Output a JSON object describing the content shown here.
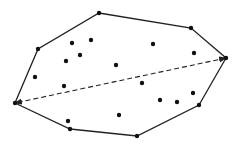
{
  "diagram": {
    "type": "convex-hull-diameter",
    "colors": {
      "line": "#222222",
      "point": "#111111",
      "background": "#ffffff"
    },
    "hull_vertices": [
      [
        99,
        13
      ],
      [
        191,
        28
      ],
      [
        226,
        58
      ],
      [
        199,
        105
      ],
      [
        137,
        136
      ],
      [
        70,
        129
      ],
      [
        15,
        103
      ],
      [
        38,
        49
      ]
    ],
    "interior_points": [
      [
        72,
        43
      ],
      [
        91,
        40
      ],
      [
        80,
        55
      ],
      [
        66,
        61
      ],
      [
        116,
        65
      ],
      [
        35,
        77
      ],
      [
        64,
        86
      ],
      [
        153,
        44
      ],
      [
        194,
        53
      ],
      [
        142,
        83
      ],
      [
        160,
        100
      ],
      [
        177,
        102
      ],
      [
        193,
        93
      ],
      [
        68,
        121
      ],
      [
        119,
        115
      ]
    ],
    "diameter": {
      "from": [
        226,
        58
      ],
      "to": [
        15,
        103
      ],
      "style": "dashed",
      "arrows": "both"
    }
  }
}
